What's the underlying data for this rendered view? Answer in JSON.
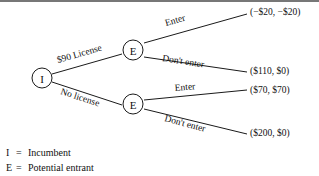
{
  "diagram": {
    "nodes": [
      {
        "id": "root",
        "label": "I",
        "name": "incumbent-node"
      },
      {
        "id": "e-upper",
        "label": "E",
        "name": "entrant-node-upper"
      },
      {
        "id": "e-lower",
        "label": "E",
        "name": "entrant-node-lower"
      }
    ],
    "branches": {
      "license": "$90 License",
      "no_license": "No license",
      "enter_upper": "Enter",
      "dont_enter_upper": "Don't enter",
      "enter_lower": "Enter",
      "dont_enter_lower": "Don't enter"
    },
    "payoffs": [
      {
        "id": "payoff-1",
        "text": "(−$20, −$20)"
      },
      {
        "id": "payoff-2",
        "text": "($110, $0)"
      },
      {
        "id": "payoff-3",
        "text": "($70, $70)"
      },
      {
        "id": "payoff-4",
        "text": "($200, $0)"
      }
    ],
    "legend": [
      {
        "key": "I",
        "eq": "=",
        "text": "Incumbent"
      },
      {
        "key": "E",
        "eq": "=",
        "text": "Potential entrant"
      }
    ],
    "colors": {
      "line": "#1a1a1a",
      "text": "#111111",
      "background": "#ffffff",
      "rule": "#4a4a4a"
    }
  }
}
